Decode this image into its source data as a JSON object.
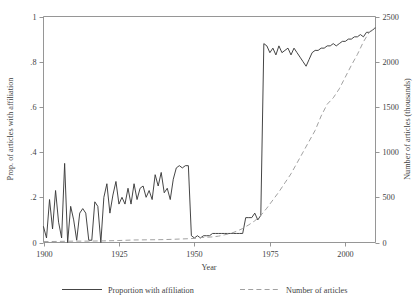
{
  "chart_data": {
    "type": "line",
    "title": "",
    "xlabel": "Year",
    "ylabel": "Prop. of articles with affiliation",
    "y2label": "Number of articles (thousands)",
    "xlim": [
      1900,
      2010
    ],
    "ylim": [
      0,
      1
    ],
    "y2lim": [
      0,
      2500
    ],
    "grid": false,
    "legend_position": "bottom",
    "xticks": [
      1900,
      1925,
      1950,
      1975,
      2000
    ],
    "xticklabels": [
      "1900",
      "1925",
      "1950",
      "1975",
      "2000"
    ],
    "yticks": [
      0,
      0.2,
      0.4,
      0.6,
      0.8,
      1
    ],
    "yticklabels": [
      "0",
      ".2",
      ".4",
      ".6",
      ".8",
      "1"
    ],
    "y2ticks": [
      0,
      500,
      1000,
      1500,
      2000,
      2500
    ],
    "y2ticklabels": [
      "0",
      "500",
      "1000",
      "1500",
      "2000",
      "2500"
    ],
    "series": [
      {
        "name": "Proportion with affiliation",
        "axis": "left",
        "style": "solid",
        "color": "#3b3b3b",
        "x": [
          1900,
          1901,
          1902,
          1903,
          1904,
          1905,
          1906,
          1907,
          1908,
          1909,
          1910,
          1911,
          1912,
          1913,
          1914,
          1915,
          1916,
          1917,
          1918,
          1919,
          1920,
          1921,
          1922,
          1923,
          1924,
          1925,
          1926,
          1927,
          1928,
          1929,
          1930,
          1931,
          1932,
          1933,
          1934,
          1935,
          1936,
          1937,
          1938,
          1939,
          1940,
          1941,
          1942,
          1943,
          1944,
          1945,
          1946,
          1947,
          1948,
          1949,
          1950,
          1951,
          1952,
          1953,
          1954,
          1955,
          1956,
          1957,
          1958,
          1959,
          1960,
          1961,
          1962,
          1963,
          1964,
          1965,
          1966,
          1967,
          1968,
          1969,
          1970,
          1971,
          1972,
          1973,
          1974,
          1975,
          1976,
          1977,
          1978,
          1979,
          1980,
          1981,
          1982,
          1983,
          1984,
          1985,
          1986,
          1987,
          1988,
          1989,
          1990,
          1991,
          1992,
          1993,
          1994,
          1995,
          1996,
          1997,
          1998,
          1999,
          2000,
          2001,
          2002,
          2003,
          2004,
          2005,
          2006,
          2007,
          2008,
          2009,
          2010
        ],
        "y": [
          0.07,
          0.02,
          0.19,
          0.06,
          0.23,
          0.09,
          0.02,
          0.35,
          0.0,
          0.16,
          0.1,
          0.01,
          0.13,
          0.15,
          0.13,
          0.01,
          0.01,
          0.18,
          0.16,
          0.0,
          0.2,
          0.26,
          0.13,
          0.21,
          0.27,
          0.17,
          0.2,
          0.17,
          0.24,
          0.17,
          0.26,
          0.19,
          0.24,
          0.25,
          0.2,
          0.23,
          0.19,
          0.3,
          0.25,
          0.31,
          0.22,
          0.24,
          0.19,
          0.28,
          0.33,
          0.34,
          0.33,
          0.34,
          0.34,
          0.03,
          0.02,
          0.03,
          0.02,
          0.03,
          0.03,
          0.03,
          0.04,
          0.04,
          0.04,
          0.04,
          0.04,
          0.04,
          0.04,
          0.04,
          0.04,
          0.04,
          0.04,
          0.11,
          0.11,
          0.11,
          0.13,
          0.1,
          0.12,
          0.88,
          0.87,
          0.84,
          0.86,
          0.83,
          0.87,
          0.84,
          0.85,
          0.86,
          0.83,
          0.86,
          0.84,
          0.82,
          0.8,
          0.78,
          0.81,
          0.84,
          0.85,
          0.85,
          0.86,
          0.86,
          0.87,
          0.87,
          0.88,
          0.87,
          0.88,
          0.89,
          0.89,
          0.9,
          0.9,
          0.91,
          0.91,
          0.92,
          0.91,
          0.93,
          0.93,
          0.94,
          0.95
        ]
      },
      {
        "name": "Number of articles",
        "axis": "right",
        "style": "dashed",
        "color": "#9c9c9c",
        "x": [
          1900,
          1905,
          1910,
          1915,
          1920,
          1925,
          1930,
          1935,
          1940,
          1945,
          1948,
          1950,
          1952,
          1954,
          1956,
          1958,
          1960,
          1962,
          1964,
          1966,
          1968,
          1970,
          1972,
          1974,
          1976,
          1978,
          1980,
          1982,
          1984,
          1986,
          1988,
          1990,
          1992,
          1994,
          1996,
          1998,
          2000,
          2002,
          2004,
          2006,
          2008,
          2010
        ],
        "y": [
          10,
          12,
          15,
          15,
          18,
          22,
          28,
          30,
          32,
          38,
          42,
          45,
          55,
          58,
          62,
          70,
          85,
          100,
          125,
          155,
          195,
          240,
          300,
          380,
          470,
          560,
          660,
          760,
          880,
          1000,
          1120,
          1240,
          1400,
          1530,
          1600,
          1700,
          1830,
          1960,
          2080,
          2220,
          2330,
          2380
        ]
      }
    ]
  },
  "axes": {
    "y_left_title": "Prop. of articles with affiliation",
    "y_right_title": "Number of articles (thousands)",
    "x_title": "Year"
  },
  "legend": {
    "items": [
      {
        "label": "Proportion with affiliation",
        "style": "solid"
      },
      {
        "label": "Number of articles",
        "style": "dashed"
      }
    ]
  }
}
